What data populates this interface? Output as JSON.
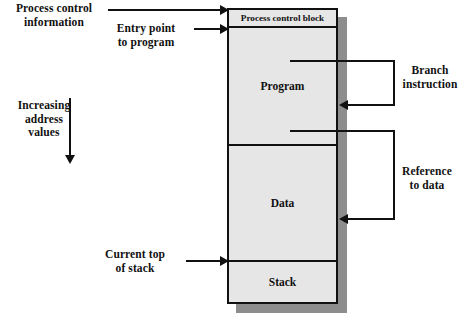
{
  "diagram": {
    "memory_block": {
      "segments": [
        {
          "id": "pcb",
          "label": "Process control block"
        },
        {
          "id": "program",
          "label": "Program"
        },
        {
          "id": "data",
          "label": "Data"
        },
        {
          "id": "stack",
          "label": "Stack"
        }
      ],
      "fill_color": "#e6e6e6",
      "border_color": "#111111",
      "shadow_color": "#8d8d8d"
    },
    "annotations": {
      "process_control_information": "Process control\ninformation",
      "entry_point_to_program": "Entry point\nto program",
      "increasing_address_values": "Increasing\naddress\nvalues",
      "current_top_of_stack": "Current top\nof stack",
      "branch_instruction": "Branch\ninstruction",
      "reference_to_data": "Reference\nto data"
    },
    "caption": ""
  }
}
